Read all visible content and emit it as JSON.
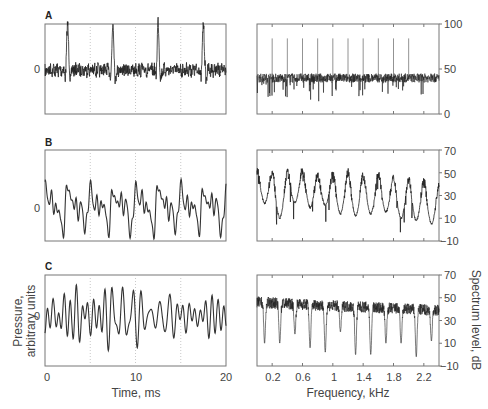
{
  "chart_data": [
    {
      "id": "A-time",
      "panel": "A",
      "type": "line",
      "title": "",
      "xlabel": "",
      "ylabel": "",
      "xlim": [
        0,
        20
      ],
      "x_unit": "ms",
      "yticks": [
        "0"
      ],
      "dotted_gridlines_x": [
        5,
        10,
        15
      ],
      "description": "Periodic pulse train with noise; sharp pulses at ~2.5, 7.5, 12.5, 17.5 ms",
      "pulse_times_ms": [
        2.5,
        7.5,
        12.5,
        17.5
      ],
      "pulse_period_ms": 5
    },
    {
      "id": "A-spectrum",
      "panel": "A",
      "type": "line",
      "xlim": [
        0,
        2.4
      ],
      "ylim": [
        0,
        100
      ],
      "yticks": [
        0,
        50,
        100
      ],
      "description": "Flat noise floor around 40 dB with line harmonics every 0.2 kHz reaching ~85 dB",
      "noise_floor_db": 40,
      "harmonic_peaks_khz": [
        0.2,
        0.4,
        0.6,
        0.8,
        1.0,
        1.2,
        1.4,
        1.6,
        1.8,
        2.0
      ],
      "harmonic_peak_db": 85
    },
    {
      "id": "B-time",
      "panel": "B",
      "type": "line",
      "xlim": [
        0,
        20
      ],
      "yticks": [
        "0"
      ],
      "dotted_gridlines_x": [
        5,
        10,
        15
      ],
      "description": "Quasi-periodic waveform repeating every ~5 ms"
    },
    {
      "id": "B-spectrum",
      "panel": "B",
      "type": "line",
      "xlim": [
        0,
        2.4
      ],
      "ylim": [
        -10,
        70
      ],
      "yticks": [
        -10,
        10,
        30,
        50,
        70
      ],
      "description": "Rippled spectrum with peaks every 0.2 kHz (~50 dB) and troughs (~10-20 dB)",
      "peak_khz": [
        0.0,
        0.2,
        0.4,
        0.6,
        0.8,
        1.0,
        1.2,
        1.4,
        1.6,
        1.8,
        2.0,
        2.2,
        2.4
      ],
      "peak_db": [
        52,
        50,
        50,
        52,
        48,
        48,
        50,
        47,
        48,
        45,
        44,
        42,
        38
      ],
      "trough_db": [
        22,
        8,
        22,
        18,
        20,
        12,
        10,
        12,
        14,
        8,
        6,
        3
      ]
    },
    {
      "id": "C-time",
      "panel": "C",
      "type": "line",
      "xlim": [
        0,
        20
      ],
      "xticks": [
        0,
        10,
        20
      ],
      "xlabel": "Time, ms",
      "ylabel": "Pressure, arbitrary units",
      "yticks": [
        "0"
      ],
      "dotted_gridlines_x": [
        5,
        10,
        15
      ],
      "description": "Aperiodic noise-like waveform"
    },
    {
      "id": "C-spectrum",
      "panel": "C",
      "type": "line",
      "xlim": [
        0,
        2.4
      ],
      "ylim": [
        -10,
        70
      ],
      "xticks": [
        0.2,
        0.6,
        1,
        1.4,
        1.8,
        2.2
      ],
      "yticks": [
        -10,
        10,
        30,
        50,
        70
      ],
      "xlabel": "Frequency, kHz",
      "ylabel": "Spectrum level, dB",
      "description": "Noisy rippled spectrum, peaks ~48 dB, dips every 0.2 kHz starting at 0.1 kHz",
      "dip_khz": [
        0.1,
        0.3,
        0.5,
        0.7,
        0.9,
        1.1,
        1.3,
        1.5,
        1.7,
        1.9,
        2.1,
        2.3
      ],
      "dip_db": [
        10,
        10,
        18,
        6,
        2,
        20,
        0,
        0,
        10,
        10,
        -2,
        12
      ]
    }
  ],
  "labels": {
    "panel_a": "A",
    "panel_b": "B",
    "panel_c": "C",
    "zero_tick": "0",
    "time_xlabel": "Time, ms",
    "freq_xlabel": "Frequency, kHz",
    "pressure_ylabel_line1": "Pressure,",
    "pressure_ylabel_line2": "arbitrary units",
    "spectrum_ylabel": "Spectrum level, dB",
    "time_ticks": [
      "0",
      "10",
      "20"
    ],
    "freq_ticks": [
      "0.2",
      "0.6",
      "1",
      "1.4",
      "1.8",
      "2.2"
    ],
    "a_spec_yticks": [
      "100",
      "50",
      "0"
    ],
    "db_yticks": [
      "70",
      "50",
      "30",
      "10",
      "−10"
    ]
  },
  "colors": {
    "axis": "#777777",
    "trace": "#222222",
    "grid": "#bbbbbb",
    "text": "#444444"
  }
}
